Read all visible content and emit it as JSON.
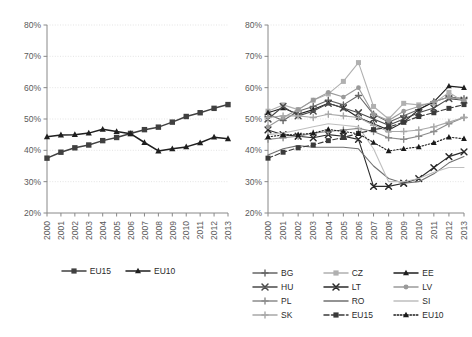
{
  "figure": {
    "background": "#ffffff",
    "panels": [
      "left",
      "right"
    ]
  },
  "chart_data": [
    {
      "panel": "left",
      "type": "line",
      "title": "",
      "xlabel": "",
      "ylabel": "",
      "x": [
        "2000",
        "2001",
        "2002",
        "2003",
        "2004",
        "2005",
        "2006",
        "2007",
        "2008",
        "2009",
        "2010",
        "2011",
        "2012",
        "2013"
      ],
      "ylim": [
        20,
        80
      ],
      "yticks": [
        20,
        30,
        40,
        50,
        60,
        70,
        80
      ],
      "ytick_labels": [
        "20%",
        "30%",
        "40%",
        "50%",
        "60%",
        "70%",
        "80%"
      ],
      "grid": "horizontal-dotted",
      "legend_position": "bottom-center",
      "series": [
        {
          "name": "EU15",
          "marker": "square",
          "color": "#404040",
          "dash": "solid",
          "values": [
            37.5,
            39.4,
            40.8,
            41.7,
            43.1,
            44.1,
            45.4,
            46.6,
            47.4,
            49.0,
            50.8,
            52.0,
            53.4,
            54.6
          ]
        },
        {
          "name": "EU10",
          "marker": "triangle",
          "color": "#1f1f1f",
          "dash": "solid",
          "values": [
            44.3,
            44.9,
            45.0,
            45.5,
            46.7,
            46.0,
            45.3,
            42.5,
            39.8,
            40.5,
            41.1,
            42.4,
            44.2,
            43.7
          ]
        }
      ]
    },
    {
      "panel": "right",
      "type": "line",
      "title": "",
      "xlabel": "",
      "ylabel": "",
      "x": [
        "2000",
        "2001",
        "2002",
        "2003",
        "2004",
        "2005",
        "2006",
        "2007",
        "2008",
        "2009",
        "2010",
        "2011",
        "2012",
        "2013"
      ],
      "ylim": [
        20,
        80
      ],
      "yticks": [
        20,
        30,
        40,
        50,
        60,
        70,
        80
      ],
      "ytick_labels": [
        "20%",
        "30%",
        "40%",
        "50%",
        "60%",
        "70%",
        "80%"
      ],
      "grid": "horizontal-dotted",
      "legend_position": "bottom",
      "series": [
        {
          "name": "BG",
          "marker": "plus",
          "color": "#666666",
          "dash": "solid",
          "values": [
            51.5,
            49.5,
            52.5,
            54.0,
            56.0,
            54.5,
            57.5,
            51.5,
            49.0,
            51.0,
            53.0,
            55.5,
            57.0,
            56.5
          ]
        },
        {
          "name": "CZ",
          "marker": "square",
          "color": "#b0b0b0",
          "dash": "solid",
          "values": [
            52.5,
            54.5,
            53.0,
            56.0,
            58.0,
            62.0,
            68.0,
            54.0,
            50.0,
            55.0,
            54.5,
            55.0,
            58.5,
            55.5
          ]
        },
        {
          "name": "EE",
          "marker": "triangle",
          "color": "#1f1f1f",
          "dash": "solid",
          "values": [
            52.0,
            53.5,
            51.5,
            53.0,
            55.0,
            53.5,
            50.5,
            48.5,
            46.5,
            49.0,
            53.0,
            55.5,
            60.5,
            60.0
          ]
        },
        {
          "name": "HU",
          "marker": "cross",
          "color": "#4a4a4a",
          "dash": "solid",
          "values": [
            50.0,
            54.0,
            51.0,
            52.5,
            55.0,
            53.5,
            52.0,
            50.0,
            48.0,
            50.0,
            52.0,
            53.5,
            56.5,
            56.0
          ]
        },
        {
          "name": "LT",
          "marker": "cross",
          "color": "#2b2b2b",
          "dash": "solid",
          "values": [
            46.5,
            45.0,
            44.5,
            44.0,
            45.0,
            44.5,
            43.5,
            28.5,
            28.5,
            29.5,
            31.0,
            34.5,
            38.0,
            39.5
          ]
        },
        {
          "name": "LV",
          "marker": "circle",
          "color": "#9a9a9a",
          "dash": "solid",
          "values": [
            47.5,
            50.5,
            53.0,
            56.0,
            58.5,
            57.0,
            60.0,
            51.5,
            49.5,
            52.5,
            54.0,
            55.5,
            57.0,
            56.0
          ]
        },
        {
          "name": "PL",
          "marker": "plus",
          "color": "#8c8c8c",
          "dash": "solid",
          "values": [
            43.5,
            44.0,
            44.5,
            45.5,
            46.0,
            46.5,
            47.0,
            46.0,
            44.0,
            43.5,
            44.5,
            46.0,
            48.5,
            50.5
          ]
        },
        {
          "name": "RO",
          "marker": "none",
          "color": "#707070",
          "dash": "solid",
          "values": [
            38.5,
            40.5,
            41.5,
            41.0,
            41.0,
            41.0,
            40.5,
            35.0,
            31.0,
            29.5,
            30.0,
            32.5,
            36.0,
            38.0
          ]
        },
        {
          "name": "SI",
          "marker": "none",
          "color": "#bfbfbf",
          "dash": "solid",
          "values": [
            45.0,
            45.5,
            46.5,
            47.5,
            48.5,
            48.0,
            47.5,
            40.5,
            30.0,
            30.0,
            31.0,
            33.0,
            34.5,
            34.5
          ]
        },
        {
          "name": "SK",
          "marker": "plus",
          "color": "#a8a8a8",
          "dash": "solid",
          "values": [
            50.5,
            51.0,
            51.0,
            50.5,
            51.5,
            51.0,
            50.5,
            48.0,
            46.0,
            46.0,
            46.5,
            47.5,
            49.0,
            50.5
          ]
        },
        {
          "name": "EU15",
          "marker": "square",
          "color": "#3a3a3a",
          "dash": "dashed",
          "values": [
            37.5,
            39.4,
            40.8,
            41.7,
            43.1,
            44.1,
            45.4,
            46.6,
            47.4,
            49.0,
            50.8,
            52.0,
            53.4,
            54.6
          ]
        },
        {
          "name": "EU10",
          "marker": "triangle",
          "color": "#1a1a1a",
          "dash": "dotted",
          "values": [
            44.3,
            44.9,
            45.0,
            45.5,
            46.7,
            46.0,
            45.3,
            42.5,
            39.8,
            40.5,
            41.1,
            42.4,
            44.2,
            43.7
          ]
        }
      ]
    }
  ]
}
